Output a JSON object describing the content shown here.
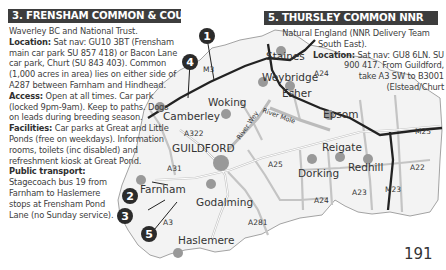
{
  "sections": [
    {
      "heading": "3. FRENSHAM COMMON & COUNTRY PARK",
      "owner": "Waverley BC and National Trust.",
      "location_label": "Location:",
      "location_text": "Sat nav: GU10 3BT (Frensham main car park SU 857 418) or Bacon Lane car park, Churt (SU 843 403). Common (1,000 acres in area) lies on either side of A287 between Farnham and Hindhead.",
      "access_label": "Access:",
      "access_text": "Open at all times. Car park (locked 9pm-9am). Keep to paths. Dogs on leads during breeding season.",
      "facilities_label": "Facilities:",
      "facilities_text": "Car parks at Great and Little Ponds (free on weekdays). Information rooms, toilets (inc disabled) and refreshment kiosk at Great Pond.",
      "transport_label": "Public transport:",
      "transport_text": "Stagecoach bus 19 from Farnham to Haslemere stops at Frensham Pond Lane (no Sunday service)."
    },
    {
      "heading": "5. THURSLEY COMMON NNR",
      "owner_lines": [
        "Natural England (NNR Delivery Team",
        "South East)."
      ],
      "location_label": "Location:",
      "location_lines": [
        "Sat nav: GU8 6LN. SU",
        "900 417. From Guildford,",
        "take A3 SW to B3001",
        "(Elstead/Churt"
      ]
    }
  ],
  "map": {
    "towns": [
      "Staines",
      "Weybridge",
      "Esher",
      "Woking",
      "Camberley",
      "Epsom",
      "GUILDFORD",
      "Reigate",
      "Redhill",
      "Dorking",
      "Farnham",
      "Godalming",
      "Haslemere"
    ],
    "roads": [
      "M3",
      "A322",
      "A31",
      "A25",
      "A24",
      "A24",
      "A23",
      "M23",
      "M25",
      "A22",
      "A3",
      "A281"
    ],
    "rivers": [
      "River Wey",
      "River Mole"
    ],
    "site_markers": [
      "1",
      "2",
      "3",
      "4",
      "5"
    ]
  },
  "page_number": "191"
}
